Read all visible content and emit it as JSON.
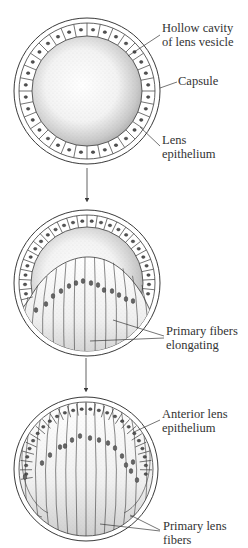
{
  "figure": {
    "stages": [
      {
        "id": "stage-1",
        "name": "lens-vesicle",
        "center": [
          87,
          91
        ],
        "radius": 73,
        "labels": [
          {
            "lines": [
              "Hollow cavity",
              "of lens vesicle"
            ],
            "x": 162,
            "y": 21
          },
          {
            "lines": [
              "Capsule"
            ],
            "x": 178,
            "y": 74
          },
          {
            "lines": [
              "Lens",
              "epithelium"
            ],
            "x": 162,
            "y": 133
          }
        ]
      },
      {
        "id": "stage-2",
        "name": "primary-fibers-elongating",
        "center": [
          87,
          283
        ],
        "radius": 73,
        "labels": [
          {
            "lines": [
              "Primary fibers",
              "elongating"
            ],
            "x": 166,
            "y": 324
          }
        ]
      },
      {
        "id": "stage-3",
        "name": "mature-lens",
        "center": [
          86,
          469
        ],
        "radius": 72,
        "labels": [
          {
            "lines": [
              "Anterior lens",
              "epithelium"
            ],
            "x": 162,
            "y": 407
          },
          {
            "lines": [
              "Primary lens",
              "fibers"
            ],
            "x": 163,
            "y": 519
          }
        ]
      }
    ],
    "arrows": [
      {
        "x": 87,
        "y1": 168,
        "y2": 202
      },
      {
        "x": 86,
        "y1": 358,
        "y2": 392
      }
    ],
    "colors": {
      "ink": "#3a3a3a",
      "background": "#ffffff",
      "stipple": "#6b6b6b"
    }
  },
  "text": {
    "s1_l1a": "Hollow cavity",
    "s1_l1b": "of lens vesicle",
    "s1_l2": "Capsule",
    "s1_l3a": "Lens",
    "s1_l3b": "epithelium",
    "s2_l1a": "Primary fibers",
    "s2_l1b": "elongating",
    "s3_l1a": "Anterior lens",
    "s3_l1b": "epithelium",
    "s3_l2a": "Primary lens",
    "s3_l2b": "fibers"
  }
}
